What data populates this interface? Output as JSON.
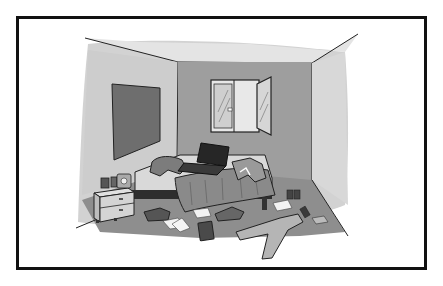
{
  "image": {
    "description": "Grayscale cartoon illustration of a messy bedroom inside a black rectangular frame",
    "scene": "messy-bedroom",
    "objects": [
      "framed-border",
      "ceiling",
      "left-wall",
      "back-wall",
      "right-wall",
      "floor",
      "picture-board",
      "window-open-casement",
      "bed",
      "laptop",
      "clothes-on-bed",
      "blanket",
      "nightstand",
      "cups",
      "alarm-clock",
      "shoes",
      "papers",
      "book",
      "jeans",
      "cans",
      "socks"
    ],
    "colors": {
      "frame": "#111111",
      "background": "#ffffff",
      "ceiling": "#e6e6e6",
      "back_wall": "#9a9a9a",
      "side_wall": "#cfcfcf",
      "floor": "#8c8c8c",
      "board": "#6e6e6e",
      "laptop": "#2a2a2a",
      "blanket": "#8a8a8a"
    }
  }
}
